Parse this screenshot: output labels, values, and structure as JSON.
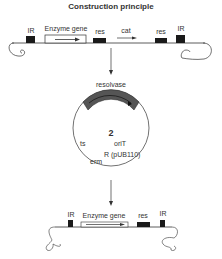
{
  "title": "Construction principle",
  "top_construct": {
    "labels": [
      "IR",
      "Enzyme gene",
      "res",
      "cat",
      "res",
      "IR"
    ]
  },
  "plasmid": {
    "resolvase_label": "resolvase",
    "number": "2",
    "labels": {
      "ts": "ts",
      "oriT": "oriT",
      "R": "R (pUB110)",
      "erm": "erm"
    }
  },
  "bottom_construct": {
    "labels": [
      "IR",
      "Enzyme gene",
      "res",
      "IR"
    ]
  },
  "colors": {
    "line": "#333333",
    "box_fill": "#1a1a1a",
    "resolvase_band": "#555555"
  }
}
